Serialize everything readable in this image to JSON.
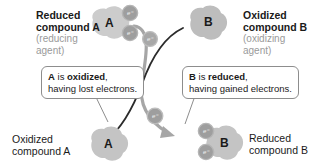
{
  "diagram": {
    "colors": {
      "blob_fill": "#c9c9c9",
      "blob_fill_light": "#d6d6d6",
      "electron_fill": "#9b9b9b",
      "arrow_gray": "#a6a6a6",
      "arrow_dark": "#2b2b2b",
      "text_dark": "#1a1a1a",
      "text_gray": "#9a9a9a",
      "callout_border": "#8d8d8d",
      "background": "#ffffff"
    },
    "labels": {
      "reduced_a_title": "Reduced",
      "reduced_a_title2": "compound A",
      "reduced_a_sub1": "(reducing",
      "reduced_a_sub2": "agent)",
      "oxidized_b_title": "Oxidized",
      "oxidized_b_title2": "compound B",
      "oxidized_b_sub1": "(oxidizing",
      "oxidized_b_sub2": "agent)",
      "oxidized_a_title": "Oxidized",
      "oxidized_a_title2": "compound A",
      "reduced_b_title": "Reduced",
      "reduced_b_title2": "compound B"
    },
    "callouts": {
      "left": {
        "line1_bold_a": "A",
        "line1_mid": " is ",
        "line1_bold_b": "oxidized",
        "line1_end": ",",
        "line2": "having lost electrons."
      },
      "right": {
        "line1_bold_a": "B",
        "line1_mid": " is ",
        "line1_bold_b": "reduced",
        "line1_end": ",",
        "line2": "having gained electrons."
      }
    },
    "molecules": {
      "compound_a_top": "A",
      "compound_b_top": "B",
      "compound_a_bottom": "A",
      "compound_b_bottom": "B"
    },
    "electrons": {
      "glyph": "e",
      "charge": "-",
      "count_top_a": 2,
      "count_in_transit": 2,
      "count_bottom_b": 2
    }
  }
}
